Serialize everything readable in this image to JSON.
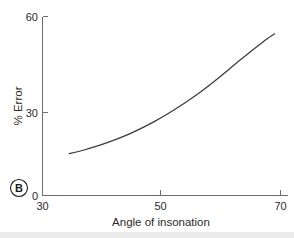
{
  "panel": {
    "letter": "B"
  },
  "chart_data": {
    "type": "line",
    "title": "",
    "subtitle": "",
    "xlabel": "Angle of insonation",
    "ylabel": "% Error",
    "xlim": [
      30,
      70
    ],
    "ylim": [
      0,
      60
    ],
    "xticks": [
      30,
      50,
      70
    ],
    "xticklabels": [
      "30",
      "50",
      "70"
    ],
    "yticks": [
      0,
      30,
      60
    ],
    "yticklabels": [
      "0",
      "30",
      "60"
    ],
    "grid": false,
    "legend": null,
    "legend_position": "none",
    "annotations": [
      "B"
    ],
    "series": [
      {
        "name": "% Error vs angle of insonation",
        "color": "#3b3b3b",
        "x": [
          34.5,
          36,
          38,
          40,
          42,
          44,
          46,
          48,
          50,
          52,
          54,
          56,
          58,
          60,
          62,
          64,
          66,
          68,
          69
        ],
        "values": [
          14.0,
          14.7,
          15.8,
          17.1,
          18.5,
          20.1,
          21.9,
          23.9,
          26.1,
          28.5,
          31.1,
          33.9,
          36.9,
          40.1,
          43.4,
          46.7,
          49.9,
          52.9,
          54.2
        ]
      }
    ]
  },
  "axes": {
    "x_tick_labels": [
      "30",
      "50",
      "70"
    ],
    "y_tick_labels": [
      "0",
      "30",
      "60"
    ],
    "x_axis_title": "Angle of insonation",
    "y_axis_title": "% Error"
  },
  "colors": {
    "curve": "#3b3b3b",
    "axis": "#6e6e6e",
    "text": "#2a2a2a",
    "background": "#ffffff",
    "bottom_strip": "#ececed"
  }
}
